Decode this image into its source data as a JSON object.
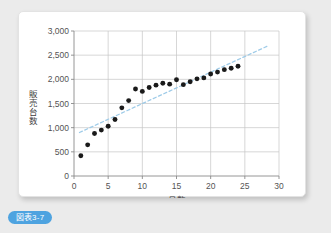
{
  "caption": {
    "badge_label": "図表3-7"
  },
  "colors": {
    "background": "#ebebeb",
    "card": "#ffffff",
    "grid": "#c6c6c6",
    "axis": "#8a8a8a",
    "point": "#1a1a1a",
    "trendline": "#9ecbe8",
    "badge": "#4ea3e0",
    "tick_text": "#545454"
  },
  "chart_data": {
    "type": "scatter",
    "title": "",
    "xlabel": "月数",
    "ylabel": "販売台数",
    "xlim": [
      0,
      30
    ],
    "ylim": [
      0,
      3000
    ],
    "xticks": [
      0,
      5,
      10,
      15,
      20,
      25,
      30
    ],
    "yticks": [
      0,
      500,
      1000,
      1500,
      2000,
      2500,
      3000
    ],
    "xtick_labels": [
      "0",
      "5",
      "10",
      "15",
      "20",
      "25",
      "30"
    ],
    "ytick_labels": [
      "0",
      "500",
      "1,000",
      "1,500",
      "2,000",
      "2,500",
      "3,000"
    ],
    "grid": true,
    "legend": "none",
    "x": [
      1,
      2,
      3,
      4,
      5,
      6,
      7,
      8,
      9,
      10,
      11,
      12,
      13,
      14,
      15,
      16,
      17,
      18,
      19,
      20,
      21,
      22,
      23,
      24
    ],
    "y": [
      420,
      645,
      880,
      950,
      1030,
      1170,
      1410,
      1560,
      1800,
      1750,
      1830,
      1880,
      1920,
      1900,
      1990,
      1890,
      1950,
      2010,
      2030,
      2110,
      2150,
      2200,
      2230,
      2270
    ],
    "series": [
      {
        "name": "販売台数",
        "marker": "filled-circle",
        "values": [
          420,
          645,
          880,
          950,
          1030,
          1170,
          1410,
          1560,
          1800,
          1750,
          1830,
          1880,
          1920,
          1900,
          1990,
          1890,
          1950,
          2010,
          2030,
          2110,
          2150,
          2200,
          2230,
          2270
        ]
      }
    ],
    "trendline": {
      "style": "dashed",
      "x_start": 0.8,
      "y_start": 900,
      "x_end": 28.5,
      "y_end": 2700
    }
  }
}
